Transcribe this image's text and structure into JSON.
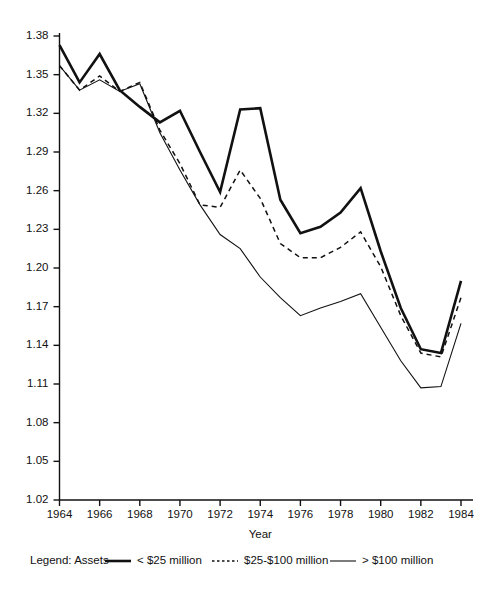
{
  "chart_data": {
    "type": "line",
    "title": "",
    "xlabel": "Year",
    "ylabel": "",
    "xlim": [
      1964,
      1984
    ],
    "ylim": [
      1.02,
      1.38
    ],
    "grid": false,
    "legend_position": "below-axis",
    "legend_title": "Legend: Assets",
    "x": [
      1964,
      1965,
      1966,
      1967,
      1968,
      1969,
      1970,
      1971,
      1972,
      1973,
      1974,
      1975,
      1976,
      1977,
      1978,
      1979,
      1980,
      1981,
      1982,
      1983,
      1984
    ],
    "xticks": [
      1964,
      1966,
      1968,
      1970,
      1972,
      1974,
      1976,
      1978,
      1980,
      1982,
      1984
    ],
    "xticklabels": [
      "1964",
      "1966",
      "1968",
      "1970",
      "1972",
      "1974",
      "1976",
      "1978",
      "1980",
      "1982",
      "1984"
    ],
    "yticks": [
      1.02,
      1.05,
      1.08,
      1.11,
      1.14,
      1.17,
      1.2,
      1.23,
      1.26,
      1.29,
      1.32,
      1.35,
      1.38
    ],
    "yticklabels": [
      "1.02",
      "1.05",
      "1.08",
      "1.11",
      "1.14",
      "1.17",
      "1.20",
      "1.23",
      "1.26",
      "1.29",
      "1.32",
      "1.35",
      "1.38"
    ],
    "series": [
      {
        "name": "< $25 million",
        "style": "solid-thick",
        "stroke_width": 2.6,
        "dash": "none",
        "color": "#111111",
        "values": [
          1.373,
          1.344,
          1.366,
          1.338,
          1.325,
          1.313,
          1.322,
          1.29,
          1.259,
          1.323,
          1.324,
          1.253,
          1.227,
          1.232,
          1.243,
          1.262,
          1.213,
          1.169,
          1.137,
          1.134,
          1.19
        ]
      },
      {
        "name": "$25-$100 million",
        "style": "dashed",
        "stroke_width": 1.5,
        "dash": "5,4",
        "color": "#111111",
        "values": [
          1.357,
          1.338,
          1.349,
          1.337,
          1.344,
          1.307,
          1.281,
          1.249,
          1.247,
          1.276,
          1.254,
          1.219,
          1.208,
          1.208,
          1.216,
          1.228,
          1.201,
          1.163,
          1.134,
          1.131,
          1.177
        ]
      },
      {
        "name": "> $100 million",
        "style": "solid-thin",
        "stroke_width": 1.1,
        "dash": "none",
        "color": "#111111",
        "values": [
          1.357,
          1.338,
          1.346,
          1.337,
          1.343,
          1.305,
          1.276,
          1.249,
          1.226,
          1.215,
          1.193,
          1.177,
          1.163,
          1.169,
          1.174,
          1.18,
          1.154,
          1.128,
          1.107,
          1.108,
          1.157
        ]
      }
    ],
    "legend_entries": [
      {
        "label": "< $25 million",
        "style": "solid-thick"
      },
      {
        "label": "$25-$100 million",
        "style": "dashed"
      },
      {
        "label": "> $100 million",
        "style": "solid-thin"
      }
    ],
    "caption": ""
  }
}
